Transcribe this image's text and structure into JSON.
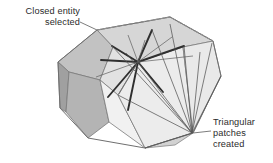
{
  "figure": {
    "type": "3d-polyhedron-annotation-diagram",
    "background_color": "#ffffff",
    "annotations": [
      {
        "name": "closed-entity-selected",
        "lines": [
          "Closed entity",
          "selected"
        ],
        "align": "right",
        "text_color": "#2b2b2b",
        "leader_line": {
          "from_x": 80,
          "from_y": 22,
          "to_x": 97,
          "to_y": 30,
          "color": "#6e6e6e"
        }
      },
      {
        "name": "triangular-patches-created",
        "lines": [
          "Triangular",
          "patches",
          "created"
        ],
        "align": "left",
        "text_color": "#2b2b2b",
        "leader_line": {
          "from_x": 211,
          "from_y": 131,
          "to_x": 193,
          "to_y": 133,
          "color": "#6e6e6e"
        }
      }
    ],
    "colors": {
      "face_top": "#d6d6d6",
      "face_upper_left": "#c2c2c2",
      "face_left_dark": "#a5a5a5",
      "face_lower_left": "#b4b4b4",
      "face_front_light": "#f1f1f1",
      "face_center_light": "#e4e4e4",
      "face_right_light": "#ededed",
      "face_bottom_right": "#dcdcdc",
      "edge": "#7a7a7a",
      "spoke_dark": "#2f2f2f",
      "fan_line": "#5a5a5a",
      "dashed_highlight": "#8a8a8a",
      "leader": "#6e6e6e",
      "text": "#2b2b2b"
    },
    "geometry": {
      "hub": {
        "x": 138,
        "y": 62
      },
      "fan_apex": {
        "x": 192,
        "y": 133
      },
      "outline_vertices": [
        {
          "x": 97,
          "y": 30
        },
        {
          "x": 170,
          "y": 17
        },
        {
          "x": 213,
          "y": 41
        },
        {
          "x": 221,
          "y": 76
        },
        {
          "x": 193,
          "y": 133
        },
        {
          "x": 145,
          "y": 148
        },
        {
          "x": 88,
          "y": 138
        },
        {
          "x": 60,
          "y": 108
        },
        {
          "x": 58,
          "y": 62
        }
      ]
    }
  }
}
